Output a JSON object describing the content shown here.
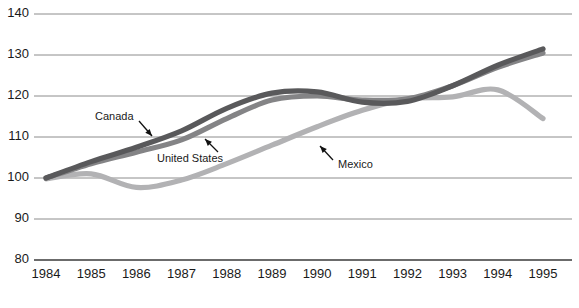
{
  "chart_data": {
    "type": "line",
    "title": "",
    "subtitle": "",
    "xlabel": "",
    "ylabel": "",
    "xlim": [
      1984,
      1995
    ],
    "ylim": [
      80,
      140
    ],
    "ytick_step": 10,
    "grid": true,
    "legend_position": "inline-annotations",
    "x": [
      1984,
      1985,
      1986,
      1987,
      1988,
      1989,
      1990,
      1991,
      1992,
      1993,
      1994,
      1995
    ],
    "xtick_labels": [
      "1984",
      "1985",
      "1986",
      "1987",
      "1988",
      "1989",
      "1990",
      "1991",
      "1992",
      "1993",
      "1994",
      "1995"
    ],
    "ytick_labels": [
      "140",
      "130",
      "120",
      "110",
      "100",
      "90",
      "80"
    ],
    "ytick_values": [
      140,
      130,
      120,
      110,
      100,
      90,
      80
    ],
    "series": [
      {
        "name": "Canada",
        "color": "#59595b",
        "values": [
          100.0,
          104.0,
          107.5,
          111.5,
          117.0,
          120.7,
          121.0,
          118.5,
          118.7,
          122.5,
          127.5,
          131.5
        ]
      },
      {
        "name": "United States",
        "color": "#848486",
        "values": [
          100.0,
          103.5,
          106.3,
          109.3,
          114.5,
          119.0,
          120.0,
          119.0,
          119.3,
          122.5,
          127.0,
          130.5
        ]
      },
      {
        "name": "Mexico",
        "color": "#b2b2b4",
        "values": [
          99.8,
          101.0,
          97.7,
          99.5,
          103.5,
          108.0,
          112.5,
          116.5,
          119.3,
          119.8,
          121.5,
          114.5
        ]
      }
    ],
    "annotations": [
      {
        "label": "Canada",
        "text_x": 95,
        "text_y": 117,
        "arrow_x1": 139,
        "arrow_y1": 121,
        "arrow_x2": 152,
        "arrow_y2": 136
      },
      {
        "label": "United States",
        "text_x": 157,
        "text_y": 159,
        "arrow_x1": 218,
        "arrow_y1": 152,
        "arrow_x2": 205,
        "arrow_y2": 139
      },
      {
        "label": "Mexico",
        "text_x": 338,
        "text_y": 165,
        "arrow_x1": 333,
        "arrow_y1": 160,
        "arrow_x2": 320,
        "arrow_y2": 146
      }
    ]
  }
}
